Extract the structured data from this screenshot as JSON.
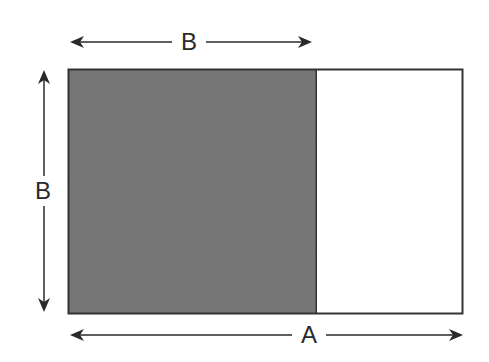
{
  "diagram": {
    "title": "",
    "labels": {
      "top": "B",
      "left": "B",
      "bottom": "A"
    },
    "colors": {
      "shaded": "#7a7a7a",
      "outline": "#333333",
      "background": "#ffffff"
    },
    "shapes": {
      "outer_rectangle": "A × B rectangle",
      "shaded_square": "B × B square"
    }
  }
}
